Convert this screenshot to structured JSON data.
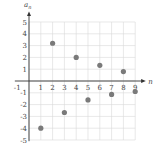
{
  "chart_data": {
    "type": "scatter",
    "title": "",
    "xlabel": "n",
    "ylabel": "a_n",
    "xlim": [
      -1,
      9
    ],
    "ylim": [
      -5,
      5
    ],
    "grid": true,
    "x_ticks": [
      "-1",
      "1",
      "2",
      "3",
      "4",
      "5",
      "6",
      "7",
      "8",
      "9"
    ],
    "y_ticks": [
      "5",
      "4",
      "3",
      "2",
      "1",
      "-1",
      "-2",
      "-3",
      "-4",
      "-5"
    ],
    "x": [
      1,
      2,
      3,
      4,
      5,
      6,
      7,
      8,
      9
    ],
    "y": [
      -4,
      3.2,
      -2.67,
      2,
      -1.6,
      1.33,
      -1.14,
      0.8,
      -0.89
    ],
    "point_color": "#7a7a7a",
    "grid_color": "#d8d8d8"
  }
}
